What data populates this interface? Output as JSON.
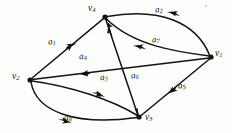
{
  "figure": {
    "kind": "directed-graph-diagram",
    "width": 232,
    "height": 133,
    "background_color": "#fdfdfc",
    "ink_color": "#15130f"
  },
  "nodes": [
    {
      "id": "v1",
      "label_base": "v",
      "label_sub": "1",
      "x": 211,
      "y": 57,
      "label_x": 215,
      "label_y": 50
    },
    {
      "id": "v2",
      "label_base": "v",
      "label_sub": "2",
      "x": 30,
      "y": 80,
      "label_x": 13,
      "label_y": 73
    },
    {
      "id": "v3",
      "label_base": "v",
      "label_sub": "3",
      "x": 139,
      "y": 117,
      "label_x": 144,
      "label_y": 113
    },
    {
      "id": "v4",
      "label_base": "v",
      "label_sub": "4",
      "x": 105,
      "y": 17,
      "label_x": 88,
      "label_y": 4
    }
  ],
  "edges": [
    {
      "id": "a1",
      "label_base": "a",
      "label_sub": "1",
      "from": "v2",
      "to": "v4",
      "shape": "straight",
      "label_x": 48,
      "label_y": 38
    },
    {
      "id": "a2",
      "label_base": "a",
      "label_sub": "2",
      "from": "v1",
      "to": "v4",
      "shape": "curve-up",
      "label_x": 155,
      "label_y": 6
    },
    {
      "id": "a3",
      "label_base": "a",
      "label_sub": "3",
      "from": "v2",
      "to": "v3",
      "shape": "curve-down",
      "label_x": 100,
      "label_y": 74
    },
    {
      "id": "a4",
      "label_base": "a",
      "label_sub": "4",
      "from": "v1",
      "to": "v2",
      "shape": "straight",
      "label_x": 79,
      "label_y": 53
    },
    {
      "id": "a5",
      "label_base": "a",
      "label_sub": "5",
      "from": "v1",
      "to": "v3",
      "shape": "straight",
      "label_x": 178,
      "label_y": 82
    },
    {
      "id": "a6",
      "label_base": "a",
      "label_sub": "6",
      "from": "v4",
      "to": "v3",
      "shape": "straight",
      "label_x": 131,
      "label_y": 72
    },
    {
      "id": "a7",
      "label_base": "a",
      "label_sub": "7",
      "from": "v1",
      "to": "v4",
      "shape": "curve-mid",
      "label_x": 152,
      "label_y": 36
    },
    {
      "id": "a8",
      "label_base": "a",
      "label_sub": "8",
      "from": "v2",
      "to": "v3",
      "shape": "curve-low",
      "label_x": 64,
      "label_y": 114
    }
  ]
}
